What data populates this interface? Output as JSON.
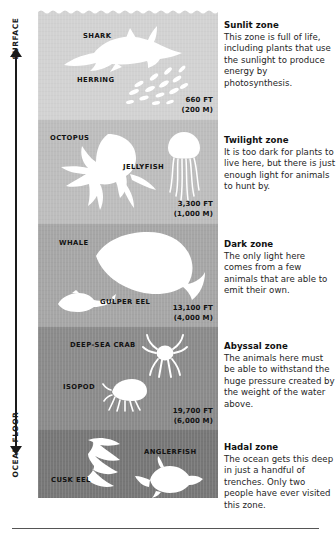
{
  "axis": {
    "top_label": "SURFACE",
    "bottom_label": "OCEAN FLOOR"
  },
  "zones": [
    {
      "id": "sunlit",
      "heading": "Sunlit zone",
      "body": "This zone is full of life, including plants that use the sunlight to produce energy by photosynthesis.",
      "color": "#d2d2d2",
      "animals": [
        "SHARK",
        "HERRING"
      ],
      "depth_feet": "660 FT",
      "depth_meters": "(200 M)"
    },
    {
      "id": "twilight",
      "heading": "Twilight zone",
      "body": "It is too dark for plants to live here, but there is just enough light for animals to hunt by.",
      "color": "#bdbdbd",
      "animals": [
        "OCTOPUS",
        "JELLYFISH"
      ],
      "depth_feet": "3,300 FT",
      "depth_meters": "(1,000 M)"
    },
    {
      "id": "dark",
      "heading": "Dark zone",
      "body": "The only light here comes from a few animals that are able to emit their own.",
      "color": "#a6a6a6",
      "animals": [
        "WHALE",
        "GULPER EEL"
      ],
      "depth_feet": "13,100 FT",
      "depth_meters": "(4,000 M)"
    },
    {
      "id": "abyssal",
      "heading": "Abyssal zone",
      "body": "The animals here must be able to withstand the huge pressure created by the weight of the water above.",
      "color": "#8b8b8b",
      "animals": [
        "DEEP-SEA CRAB",
        "ISOPOD"
      ],
      "depth_feet": "19,700 FT",
      "depth_meters": "(6,000 M)"
    },
    {
      "id": "hadal",
      "heading": "Hadal zone",
      "body": "The ocean gets this deep in just a handful of trenches. Only two people have ever visited this zone.",
      "color": "#777777",
      "animals": [
        "CUSK EEL",
        "ANGLERFISH"
      ],
      "depth_feet": "",
      "depth_meters": ""
    }
  ],
  "animal_labels": {
    "shark": "SHARK",
    "herring": "HERRING",
    "octopus": "OCTOPUS",
    "jellyfish": "JELLYFISH",
    "whale": "WHALE",
    "gulper_eel": "GULPER EEL",
    "deep_sea_crab": "DEEP-SEA CRAB",
    "isopod": "ISOPOD",
    "cusk_eel": "CUSK EEL",
    "anglerfish": "ANGLERFISH"
  },
  "depth_markers": [
    {
      "feet": "660 FT",
      "meters": "(200 M)"
    },
    {
      "feet": "3,300 FT",
      "meters": "(1,000 M)"
    },
    {
      "feet": "13,100 FT",
      "meters": "(4,000 M)"
    },
    {
      "feet": "19,700 FT",
      "meters": "(6,000 M)"
    }
  ],
  "colors": {
    "sunlit": "#d2d2d2",
    "twilight": "#bdbdbd",
    "dark": "#a6a6a6",
    "abyssal": "#8b8b8b",
    "hadal": "#777777",
    "silhouette": "#ffffff",
    "text": "#262626",
    "heading": "#111111",
    "axis": "#1a1a1a"
  }
}
